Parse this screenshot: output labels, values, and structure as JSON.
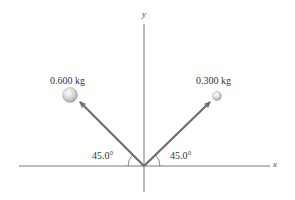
{
  "diagram": {
    "axes": {
      "x_label": "x",
      "y_label": "y"
    },
    "objects": [
      {
        "name": "heavy-ball",
        "mass_label": "0.600 kg",
        "direction": "upper-left",
        "angle_label": "45.0°"
      },
      {
        "name": "light-ball",
        "mass_label": "0.300 kg",
        "direction": "upper-right",
        "angle_label": "45.0°"
      }
    ],
    "colors": {
      "arrow": "#6e6e6e",
      "axis": "#555555",
      "ball_fill": "#d8d8d8",
      "text": "#333333"
    }
  }
}
